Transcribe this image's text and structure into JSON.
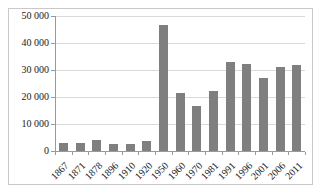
{
  "chart": {
    "bar_color": "#7f7f7f",
    "gridline_color": "#d9d9d9",
    "axis_color": "#9a9a9a",
    "frame_border_color": "#c9c9c9",
    "text_color": "#1a1a1a",
    "background_color": "#ffffff"
  },
  "chart_data": {
    "type": "bar",
    "title": "",
    "xlabel": "",
    "ylabel": "",
    "categories": [
      "1867",
      "1871",
      "1878",
      "1896",
      "1910",
      "1920",
      "1950",
      "1960",
      "1970",
      "1981",
      "1991",
      "1996",
      "2001",
      "2006",
      "2011"
    ],
    "values": [
      3000,
      3000,
      4200,
      2600,
      2500,
      3700,
      46500,
      21600,
      16700,
      22200,
      32800,
      32400,
      27000,
      31100,
      31800
    ],
    "ylim": [
      0,
      50000
    ],
    "ytick_step": 10000,
    "ytick_labels": [
      "0",
      "10 000",
      "20 000",
      "30 000",
      "40 000",
      "50 000"
    ],
    "grid": true,
    "legend": false
  }
}
